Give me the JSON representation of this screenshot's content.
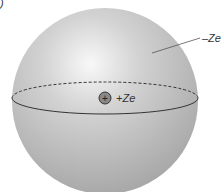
{
  "figure": {
    "corner_mark": ")",
    "sphere_label": "–Ze",
    "nucleus_symbol": "+",
    "nucleus_label": "+Ze",
    "colors": {
      "sphere_light": "#f4f4f4",
      "sphere_dark": "#9a9a9a",
      "line": "#333333"
    }
  }
}
